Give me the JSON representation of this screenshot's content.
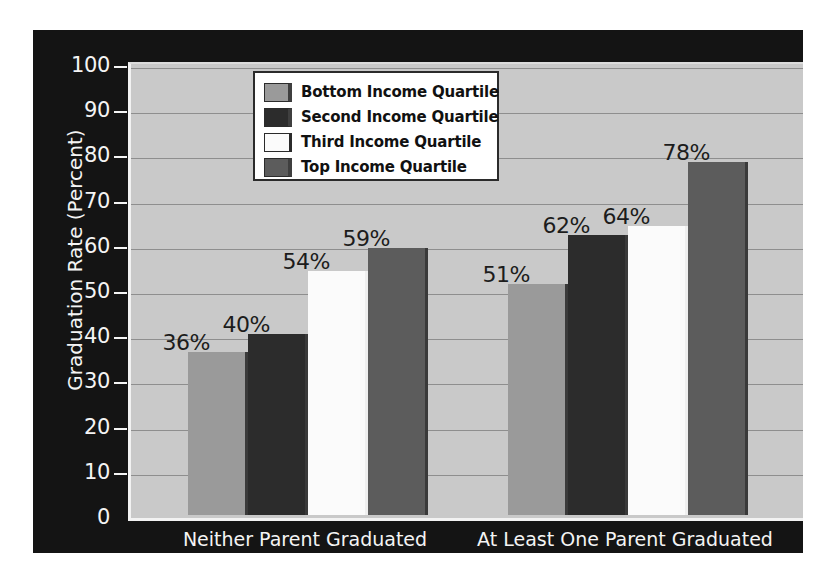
{
  "chart_data": {
    "type": "bar",
    "title": "",
    "xlabel": "",
    "ylabel": "Graduation Rate (Percent)",
    "ylim": [
      0,
      100
    ],
    "ytick_step": 10,
    "yticks": [
      "0",
      "10",
      "20",
      "30",
      "40",
      "50",
      "60",
      "70",
      "80",
      "90",
      "100"
    ],
    "grid": true,
    "legend_position": "upper-left-inside",
    "categories": [
      "Neither Parent Graduated\nfrom College",
      "At Least One Parent Graduated\nfrom College"
    ],
    "series": [
      {
        "name": "Bottom Income Quartile",
        "values": [
          36,
          51
        ],
        "labels": [
          "36%",
          "51%"
        ],
        "color": "#9a9a9a"
      },
      {
        "name": "Second Income Quartile",
        "values": [
          40,
          62
        ],
        "labels": [
          "40%",
          "62%"
        ],
        "color": "#2c2c2c"
      },
      {
        "name": "Third Income Quartile",
        "values": [
          54,
          64
        ],
        "labels": [
          "54%",
          "64%"
        ],
        "color": "#fbfbfb"
      },
      {
        "name": "Top Income Quartile",
        "values": [
          59,
          78
        ],
        "labels": [
          "59%",
          "78%"
        ],
        "color": "#5c5c5c"
      }
    ]
  },
  "figure": {
    "background_color": "#141414",
    "plot_background_color": "#c9c9c9",
    "gridline_color": "#8e8e8e",
    "axis_text_color": "#f4f4f4",
    "data_label_color": "#1c1c1c"
  },
  "legend": {
    "items": [
      {
        "label": "Bottom Income Quartile",
        "color": "#9a9a9a"
      },
      {
        "label": "Second Income Quartile",
        "color": "#2c2c2c"
      },
      {
        "label": "Third Income Quartile",
        "color": "#fbfbfb"
      },
      {
        "label": "Top Income Quartile",
        "color": "#5c5c5c"
      }
    ]
  }
}
